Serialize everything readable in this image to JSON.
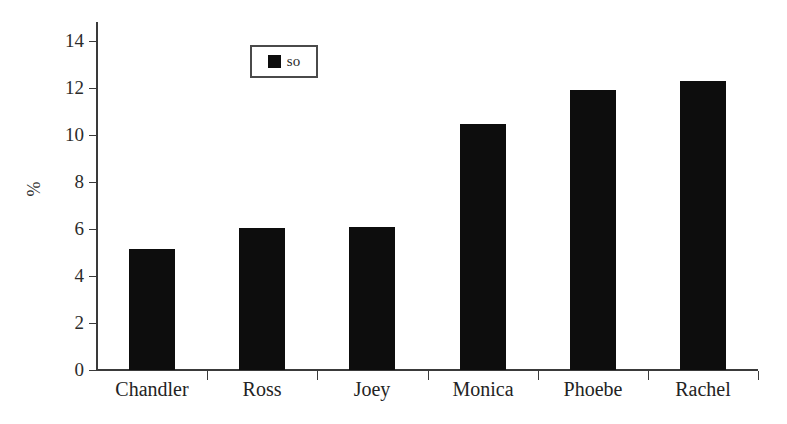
{
  "chart_data": {
    "type": "bar",
    "title": "",
    "subtitle": "",
    "xlabel": "",
    "ylabel": "%",
    "categories": [
      "Chandler",
      "Ross",
      "Joey",
      "Monica",
      "Phoebe",
      "Rachel"
    ],
    "values": [
      5.15,
      6.05,
      6.1,
      10.45,
      11.9,
      12.3
    ],
    "series": [
      {
        "name": "so",
        "values": [
          5.15,
          6.05,
          6.1,
          10.45,
          11.9,
          12.3
        ]
      }
    ],
    "ylim": [
      0,
      15
    ],
    "y_ticks": [
      0,
      2,
      4,
      6,
      8,
      10,
      12,
      14
    ],
    "y_tick_labels": [
      "0",
      "2",
      "4",
      "6",
      "8",
      "10",
      "12",
      "14"
    ],
    "grid": false,
    "legend": {
      "position": "top-left-inset",
      "entries": [
        {
          "label": "so",
          "color": "#0d0d0d"
        }
      ]
    },
    "bar_color": "#0d0d0d",
    "axis_color": "#3a3a3a",
    "background": "#ffffff"
  }
}
